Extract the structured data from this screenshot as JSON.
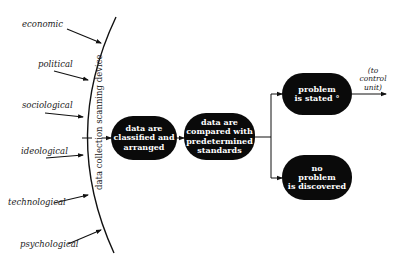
{
  "diagram": {
    "inputs": [
      {
        "label": "economic"
      },
      {
        "label": "political"
      },
      {
        "label": "sociological"
      },
      {
        "label": "ideological"
      },
      {
        "label": "technological"
      },
      {
        "label": "psychological"
      }
    ],
    "scanner_label": "data collection scanning device",
    "nodes": [
      {
        "id": "classify",
        "lines": [
          "data are",
          "classified and",
          "arranged"
        ]
      },
      {
        "id": "compare",
        "lines": [
          "data are",
          "compared with",
          "predetermined",
          "standards"
        ]
      },
      {
        "id": "stated",
        "lines": [
          "problem",
          "is stated °"
        ]
      },
      {
        "id": "none",
        "lines": [
          "no",
          "problem",
          "is discovered"
        ]
      }
    ],
    "output_note": [
      "(to",
      "control",
      "unit)"
    ],
    "colors": {
      "node_fill": "#0a0a0a",
      "node_text": "#ffffff",
      "line": "#111111"
    }
  }
}
